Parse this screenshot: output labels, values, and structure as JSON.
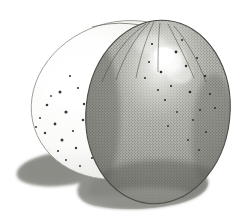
{
  "artwork": {
    "title": "Two Eggs — Graphite Stipple Study",
    "medium": "pencil / stipple drawing",
    "alt_text": "A pencil stipple drawing of two eggs, a pale speckled egg behind and a darker grey egg in front, with a soft cast shadow beneath them.",
    "canvas": {
      "width": 244,
      "height": 224,
      "background_color": "#ffffff"
    },
    "palette": {
      "background": "#ffffff",
      "paper_tint": "#fdfdfc",
      "back_egg_fill": "#f6f6f4",
      "back_egg_shade": "#d7d7d2",
      "back_egg_outline": "#8e8e88",
      "front_egg_light": "#cfcfc9",
      "front_egg_mid": "#9a9a95",
      "front_egg_dark": "#6e6e69",
      "front_egg_outline": "#4c4c48",
      "highlight": "#ffffff",
      "speckle": "#3a3a36",
      "cast_shadow": "#8d8d88",
      "cast_shadow_deep": "#7b7b76"
    },
    "objects": [
      {
        "name": "back-egg",
        "label": "Pale speckled egg (behind)",
        "center": [
          122,
          100
        ],
        "radius_x": 92,
        "radius_y": 78,
        "rotation_deg": -18,
        "surface": "fine stipple with scattered dark speckles",
        "speckle_count": 34
      },
      {
        "name": "front-egg",
        "label": "Dark grey egg (in front)",
        "center": [
          158,
          112
        ],
        "radius_x": 72,
        "radius_y": 92,
        "rotation_deg": 6,
        "surface": "dense cross-stipple, tonal gradient",
        "highlight": {
          "center": [
            168,
            60
          ],
          "radius_x": 20,
          "radius_y": 16
        },
        "speckle_count": 22
      },
      {
        "name": "cast-shadow",
        "label": "Cast shadow on ground plane",
        "extent": [
          12,
          148,
          212,
          210
        ]
      }
    ],
    "speckles_back": [
      [
        60,
        92
      ],
      [
        78,
        88
      ],
      [
        47,
        105
      ],
      [
        92,
        83
      ],
      [
        66,
        112
      ],
      [
        84,
        104
      ],
      [
        55,
        124
      ],
      [
        73,
        131
      ],
      [
        95,
        118
      ],
      [
        40,
        118
      ],
      [
        106,
        96
      ],
      [
        88,
        137
      ],
      [
        62,
        140
      ],
      [
        100,
        130
      ],
      [
        112,
        110
      ],
      [
        51,
        96
      ],
      [
        70,
        76
      ],
      [
        83,
        120
      ],
      [
        97,
        145
      ],
      [
        45,
        133
      ],
      [
        117,
        124
      ],
      [
        108,
        141
      ],
      [
        124,
        104
      ],
      [
        58,
        151
      ],
      [
        76,
        148
      ],
      [
        132,
        90
      ],
      [
        92,
        158
      ],
      [
        66,
        160
      ],
      [
        120,
        136
      ],
      [
        104,
        160
      ],
      [
        36,
        127
      ],
      [
        113,
        150
      ],
      [
        127,
        118
      ],
      [
        80,
        166
      ]
    ],
    "speckles_front": [
      [
        152,
        44
      ],
      [
        176,
        52
      ],
      [
        186,
        66
      ],
      [
        161,
        72
      ],
      [
        197,
        58
      ],
      [
        205,
        76
      ],
      [
        171,
        86
      ],
      [
        190,
        92
      ],
      [
        149,
        62
      ],
      [
        210,
        94
      ],
      [
        182,
        40
      ],
      [
        200,
        110
      ],
      [
        165,
        100
      ],
      [
        193,
        120
      ],
      [
        215,
        108
      ],
      [
        177,
        112
      ],
      [
        206,
        132
      ],
      [
        158,
        90
      ],
      [
        188,
        140
      ],
      [
        145,
        78
      ],
      [
        168,
        126
      ],
      [
        199,
        150
      ]
    ],
    "strokes": {
      "back_egg_contour_visible": true,
      "front_egg_contour_visible": true,
      "hatch_lines_top_count": 6
    }
  }
}
